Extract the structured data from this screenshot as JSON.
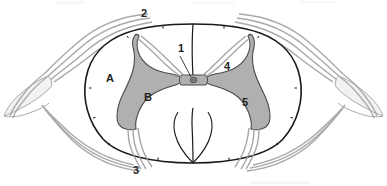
{
  "figure": {
    "background_color": "#ffffff",
    "outline_color": "#1a1a1a",
    "gray_matter_color": "#b0b0b0",
    "gray_matter_stroke": "#4a4a4a",
    "white_matter_color": "#ffffff",
    "nerve_fiber_color": "#9a9a9a",
    "ganglion_fill": "#f2f2f2",
    "ganglion_stroke": "#a8a8a8",
    "central_canal_color": "#8f8f8f"
  },
  "labels": [
    {
      "id": "label-1",
      "text": "1",
      "x": 181,
      "y": 52,
      "name": "label-central-canal",
      "target": "central canal"
    },
    {
      "id": "label-2",
      "text": "2",
      "x": 144,
      "y": 17,
      "name": "label-dorsal-root",
      "target": "dorsal (posterior) nerve root"
    },
    {
      "id": "label-3",
      "text": "3",
      "x": 136,
      "y": 174,
      "name": "label-ventral-root",
      "target": "ventral (anterior) nerve root"
    },
    {
      "id": "label-4",
      "text": "4",
      "x": 227,
      "y": 70,
      "name": "label-posterior-horn",
      "target": "posterior (dorsal) gray horn"
    },
    {
      "id": "label-5",
      "text": "5",
      "x": 245,
      "y": 106,
      "name": "label-anterior-horn",
      "target": "anterior (ventral) gray horn"
    },
    {
      "id": "label-A",
      "text": "A",
      "x": 110,
      "y": 82,
      "name": "label-white-matter",
      "target": "white matter"
    },
    {
      "id": "label-B",
      "text": "B",
      "x": 148,
      "y": 101,
      "name": "label-gray-matter",
      "target": "gray matter"
    }
  ],
  "structures": {
    "cord_outline": "spinal cord outer boundary (oval)",
    "posterior_median_sulcus": "vertical midline groove, top",
    "anterior_median_fissure": "vertical midline notch, bottom",
    "gray_commissure": "gray matter bridge across midline",
    "central_canal": "small dot at center of gray commissure",
    "left_ganglion": "spindle-shaped spinal ganglion, left",
    "right_ganglion": "spindle-shaped spinal ganglion, right",
    "dorsal_rootlets": "fanned fiber bundles entering posterior horns",
    "ventral_rootlets": "fanned fiber bundles exiting anterior horns"
  },
  "leader_lines": {
    "label_1_to_canal": "short line from label 1 down-left to central canal"
  }
}
